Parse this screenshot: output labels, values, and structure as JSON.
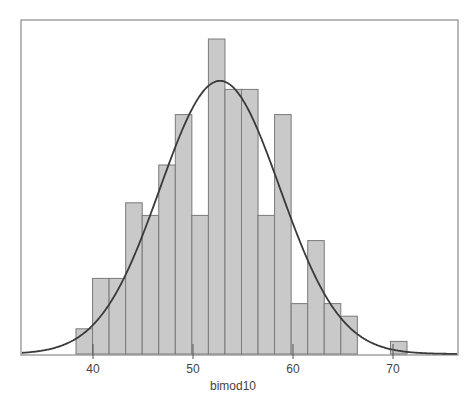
{
  "chart_data": {
    "type": "bar",
    "subtype": "histogram_with_normal_curve",
    "title": "",
    "xlabel": "bimod10",
    "ylabel": "",
    "x_ticks": [
      40,
      50,
      60,
      70
    ],
    "xlim": [
      32.7,
      76.5
    ],
    "bin_start": 38.3,
    "bin_width": 1.655,
    "bin_edges": [
      38.3,
      39.96,
      41.61,
      43.27,
      44.92,
      46.58,
      48.23,
      49.89,
      51.54,
      53.2,
      54.85,
      56.51,
      58.16,
      59.82,
      61.47,
      63.13,
      64.78,
      66.44,
      68.09,
      69.75,
      71.4
    ],
    "counts": [
      2,
      6,
      6,
      12,
      11,
      15,
      19,
      11,
      25,
      21,
      21,
      11,
      19,
      4,
      9,
      4,
      3,
      0,
      0,
      1
    ],
    "total_n": 200,
    "normal_curve": {
      "mean": 52.7,
      "sd": 6.0
    },
    "grid": false,
    "legend": null,
    "colors": {
      "bar_fill": "#c9c9c9",
      "bar_edge": "#7a7a7a",
      "curve": "#3a3a3a",
      "frame": "#8a8a8a",
      "text": "#444444"
    }
  },
  "layout": {
    "frame": {
      "left": 21,
      "top": 20,
      "right": 458,
      "bottom": 355
    },
    "px_per_unit_x": 10.0,
    "x_at_40": 93,
    "px_per_count": 12.6
  }
}
